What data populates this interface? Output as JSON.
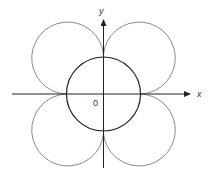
{
  "figure": {
    "type": "polar curve with inner circle",
    "axes": {
      "x_label": "x",
      "y_label": "y",
      "origin_label": "0"
    },
    "curves": [
      {
        "name": "inner-circle",
        "description": "circle centered at origin",
        "stroke": "#222222"
      },
      {
        "name": "four-leaf-outer-curve",
        "description": "four lobes, one per quadrant, meeting at the inner circle's axis intercepts",
        "stroke": "#888888"
      }
    ]
  },
  "colors": {
    "axis": "#222222",
    "inner_circle": "#222222",
    "outer_lobes": "#8a8a8a",
    "background": "#ffffff"
  }
}
